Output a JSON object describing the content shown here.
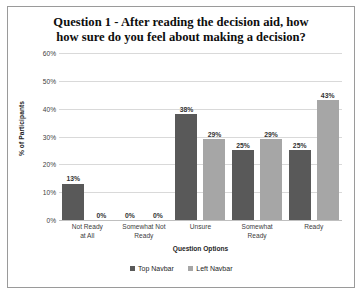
{
  "chart_data": {
    "type": "bar",
    "title": "Question 1 - After reading the decision aid, how how sure do you feel about making a decision?",
    "title_lines": [
      "Question 1 - After reading the decision aid, how",
      "how sure do you feel about making a decision?"
    ],
    "xlabel": "Question Options",
    "ylabel": "% of Participants",
    "categories": [
      "Not Ready at All",
      "Somewhat Not Ready",
      "Unsure",
      "Somewhat Ready",
      "Ready"
    ],
    "category_lines": [
      [
        "Not Ready",
        "at All"
      ],
      [
        "Somewhat Not",
        "Ready"
      ],
      [
        "Unsure"
      ],
      [
        "Somewhat",
        "Ready"
      ],
      [
        "Ready"
      ]
    ],
    "series": [
      {
        "name": "Top Navbar",
        "color": "#595959",
        "values": [
          13,
          0,
          38,
          25,
          25
        ],
        "labels": [
          "13%",
          "0%",
          "38%",
          "25%",
          "25%"
        ]
      },
      {
        "name": "Left Navbar",
        "color": "#a6a6a6",
        "values": [
          0,
          0,
          29,
          29,
          43
        ],
        "labels": [
          "0%",
          "0%",
          "29%",
          "29%",
          "43%"
        ]
      }
    ],
    "ylim": [
      0,
      60
    ],
    "ytick_values": [
      0,
      10,
      20,
      30,
      40,
      50,
      60
    ],
    "ytick_labels": [
      "0%",
      "10%",
      "20%",
      "30%",
      "40%",
      "50%",
      "60%"
    ],
    "grid": true,
    "legend_position": "bottom"
  }
}
